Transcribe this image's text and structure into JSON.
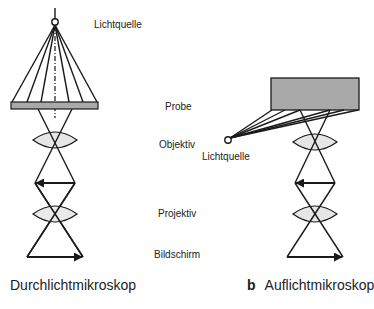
{
  "figure": {
    "panel_left": {
      "caption": "Durchlichtmikroskop",
      "panel_letter": ""
    },
    "panel_right": {
      "caption": "Auflichtmikroskop",
      "panel_letter": "b"
    },
    "labels": {
      "light_source_left": "Lichtquelle",
      "sample": "Probe",
      "objective": "Objektiv",
      "light_source_right": "Lichtquelle",
      "projective": "Projektiv",
      "screen": "Bildschirm"
    },
    "colors": {
      "line": "#1a1a1a",
      "sample_fill": "#a9a9a9",
      "lens_fill": "#e6e6e6",
      "background": "#ffffff"
    }
  }
}
